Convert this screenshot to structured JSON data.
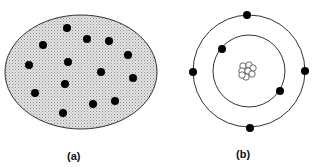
{
  "figure": {
    "panels": [
      {
        "id": "a",
        "label": "(a)",
        "description": "Shaded ellipse with scattered black dots",
        "ellipse": {
          "cx": 81,
          "cy": 72,
          "rx": 76,
          "ry": 57,
          "fill": "#d9d9d9",
          "stroke": "#333333"
        },
        "dots": [
          {
            "x": 67,
            "y": 28
          },
          {
            "x": 43,
            "y": 45
          },
          {
            "x": 87,
            "y": 39
          },
          {
            "x": 109,
            "y": 41
          },
          {
            "x": 128,
            "y": 55
          },
          {
            "x": 29,
            "y": 65
          },
          {
            "x": 68,
            "y": 62
          },
          {
            "x": 101,
            "y": 72
          },
          {
            "x": 133,
            "y": 78
          },
          {
            "x": 65,
            "y": 84
          },
          {
            "x": 35,
            "y": 93
          },
          {
            "x": 115,
            "y": 101
          },
          {
            "x": 93,
            "y": 104
          },
          {
            "x": 63,
            "y": 113
          }
        ]
      },
      {
        "id": "b",
        "label": "(b)",
        "description": "Atom model with nucleus and two electron orbits",
        "outer_orbit": {
          "cx": 249,
          "cy": 71,
          "r": 56
        },
        "inner_orbit": {
          "cx": 249,
          "cy": 71,
          "r": 36
        },
        "electrons": [
          {
            "x": 247,
            "y": 15
          },
          {
            "x": 222,
            "y": 49
          },
          {
            "x": 193,
            "y": 72
          },
          {
            "x": 305,
            "y": 71
          },
          {
            "x": 280,
            "y": 91
          },
          {
            "x": 250,
            "y": 128
          }
        ],
        "nucleus": {
          "cx": 247,
          "cy": 70
        }
      }
    ],
    "colors": {
      "dot": "#000000",
      "stroke": "#333333",
      "shade": "#d6d6d6"
    }
  }
}
